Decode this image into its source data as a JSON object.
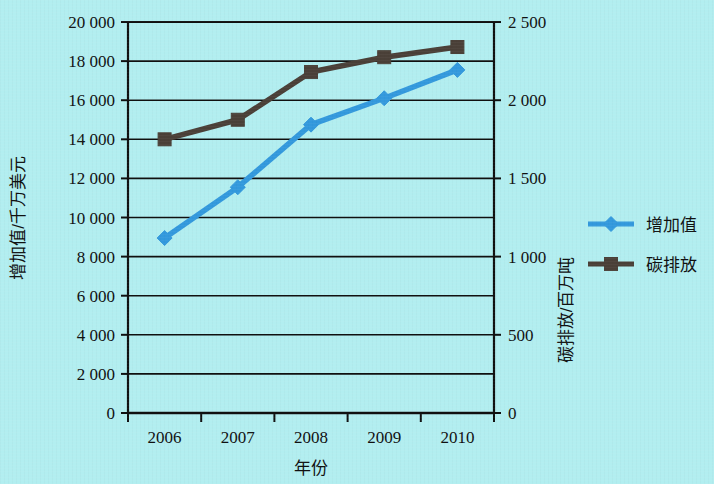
{
  "chart_data": {
    "type": "line",
    "title": "",
    "xlabel": "年份",
    "ylabel": "增加值/千万美元",
    "y2label": "碳排放/百万吨",
    "categories": [
      "2006",
      "2007",
      "2008",
      "2009",
      "2010"
    ],
    "ylim": [
      0,
      20000
    ],
    "y2lim": [
      0,
      2500
    ],
    "yticks": [
      "0",
      "2 000",
      "4 000",
      "6 000",
      "8 000",
      "10 000",
      "12 000",
      "14 000",
      "16 000",
      "18 000",
      "20 000"
    ],
    "ytick_values": [
      0,
      2000,
      4000,
      6000,
      8000,
      10000,
      12000,
      14000,
      16000,
      18000,
      20000
    ],
    "y2ticks": [
      "0",
      "500",
      "1 000",
      "1 500",
      "2 000",
      "2 500"
    ],
    "y2tick_values": [
      0,
      500,
      1000,
      1500,
      2000,
      2500
    ],
    "grid": true,
    "legend_position": "right",
    "series": [
      {
        "name": "增加值",
        "axis": "left",
        "color": "#3399dd",
        "marker": "diamond",
        "values": [
          8950,
          11550,
          14750,
          16100,
          17550
        ]
      },
      {
        "name": "碳排放",
        "axis": "right",
        "color": "#4a4038",
        "marker": "square",
        "values": [
          1750,
          1875,
          2180,
          2275,
          2340
        ]
      }
    ]
  },
  "legend": {
    "items": [
      {
        "label": "增加值",
        "color": "#3399dd",
        "marker": "diamond"
      },
      {
        "label": "碳排放",
        "color": "#4a4038",
        "marker": "square"
      }
    ]
  },
  "axes": {
    "x_title": "年份",
    "y_left_title": "增加值/千万美元",
    "y_right_title": "碳排放/百万吨"
  },
  "colors": {
    "background": "#b2eef0",
    "axis": "#101010",
    "grid": "#101010",
    "series_value": "#3399dd",
    "series_carbon": "#4a4038"
  }
}
